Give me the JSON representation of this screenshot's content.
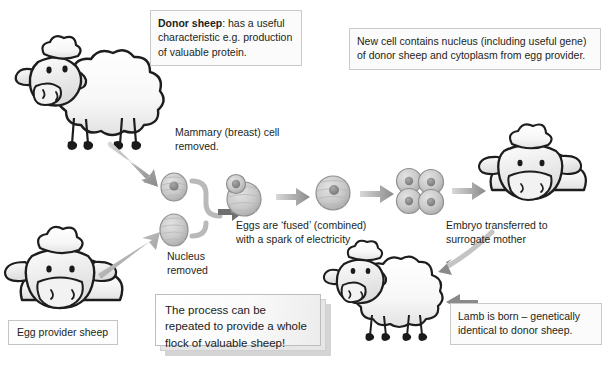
{
  "diagram": {
    "background_color": "#ffffff",
    "ink_color": "#231f20",
    "arrow_color": "#8c8c8c"
  },
  "callouts": {
    "donor_sheep": {
      "lead": "Donor sheep",
      "body": ": has a useful characteristic e.g. production of valuable protein."
    },
    "new_cell": {
      "text": "New cell contains nucleus (including useful gene) of donor sheep and cytoplasm from egg provider."
    },
    "process_repeat": {
      "text": "The process can be repeated to provide a whole flock of valuable sheep!"
    },
    "lamb_born": {
      "text": "Lamb is born – genetically identical to donor sheep."
    }
  },
  "labels": {
    "mammary_cell": "Mammary (breast) cell removed.",
    "nucleus_removed": "Nucleus removed",
    "eggs_fused": "Eggs are ‘fused’ (combined) with a spark of electricity",
    "embryo_transferred": "Embryo transferred to surrogate mother",
    "egg_provider_sheep": "Egg provider sheep"
  },
  "figures": {
    "donor_sheep": "donor-sheep-illustration",
    "egg_provider_sheep": "egg-provider-sheep-illustration",
    "surrogate_mother_sheep": "surrogate-mother-sheep-illustration",
    "cloned_lamb": "cloned-lamb-illustration",
    "mammary_cell": "mammary-cell-with-nucleus",
    "enucleated_egg": "enucleated-egg-cell",
    "fusing_cells": "fusing-cell-pair",
    "fused_cell": "fused-single-cell",
    "embryo": "four-cell-embryo"
  },
  "arrows": {
    "donor_to_cell": "arrow-donor-to-mammary-cell",
    "provider_to_egg": "arrow-provider-to-egg-cell",
    "bracket_to_fusion": "bracket-arrow-to-fusion",
    "fusion_to_fused": "arrow-fusion-to-fused-cell",
    "fused_to_embryo": "arrow-fused-to-embryo",
    "embryo_to_surrogate": "arrow-embryo-to-surrogate",
    "surrogate_to_lamb": "arrow-surrogate-to-lamb",
    "lamb_to_caption": "arrow-lamb-to-caption"
  }
}
